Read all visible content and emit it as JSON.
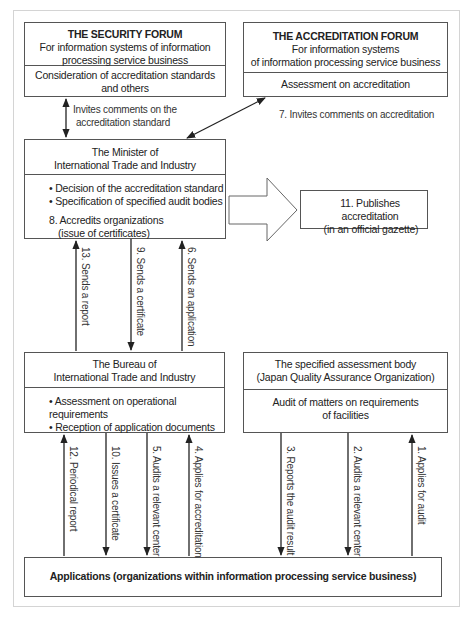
{
  "security_forum": {
    "title": "THE SECURITY FORUM",
    "subtitle_line1": "For information systems of information",
    "subtitle_line2": "processing service business",
    "role_line1": "Consideration of accreditation standards",
    "role_line2": "and others"
  },
  "accreditation_forum": {
    "title": "THE ACCREDITATION FORUM",
    "subtitle_line1": "For information systems",
    "subtitle_line2": "of information processing service business",
    "role": "Assessment on accreditation"
  },
  "minister": {
    "title_line1": "The Minister of",
    "title_line2": "International Trade and Industry",
    "bullets": [
      "Decision of the accreditation standard",
      "Specification of specified audit bodies"
    ],
    "step8_line1": "8. Accredits organizations",
    "step8_line2": "(issue of certificates)"
  },
  "publish_box": {
    "line1": "11. Publishes accreditation",
    "line2": "(in an official gazette)"
  },
  "bureau": {
    "title_line1": "The Bureau of",
    "title_line2": "International Trade and Industry",
    "bullets": [
      "Assessment on operational requirements",
      "Reception of application documents"
    ]
  },
  "assessment_body": {
    "title_line1": "The specified assessment body",
    "title_line2": "(Japan Quality Assurance Organization)",
    "role_line1": "Audit of matters on requirements",
    "role_line2": "of facilities"
  },
  "applications": {
    "label": "Applications (organizations within information processing service business)"
  },
  "arrows": {
    "invites_standard_line1": "Invites comments on the",
    "invites_standard_line2": "accreditation standard",
    "step7": "7. Invites comments on accreditation",
    "step13": "13. Sends a report",
    "step9": "9. Sends a certificate",
    "step6": "6. Sends an application",
    "step12": "12. Periodical report",
    "step10": "10. Issues a certificate",
    "step5": "5. Audits a relevant center",
    "step4": "4. Applies for accreditation",
    "step3": "3. Reports the audit result",
    "step2": "2. Audits a relevant center",
    "step1": "1. Applies for audit"
  },
  "colors": {
    "line": "#222222",
    "border": "#555555",
    "frame": "#d4d4d4"
  }
}
